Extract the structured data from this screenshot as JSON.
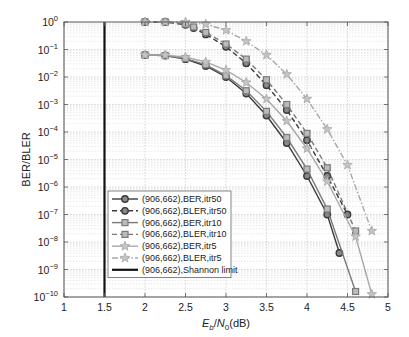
{
  "chart_data": {
    "type": "line",
    "title": "",
    "xlabel": "Eb/N0(dB)",
    "xlabel_parts": {
      "E": "E",
      "b": "b",
      "slash": "/",
      "N": "N",
      "zero": "0",
      "unit": "(dB)"
    },
    "ylabel": "BER/BLER",
    "xlim": [
      1,
      5
    ],
    "ylim_log10": [
      -10,
      0
    ],
    "yscale": "log",
    "grid": true,
    "x_ticks": [
      "1",
      "1.5",
      "2",
      "2.5",
      "3",
      "3.5",
      "4",
      "4.5",
      "5"
    ],
    "y_ticks": [
      {
        "base": "10",
        "exp": "0"
      },
      {
        "base": "10",
        "exp": "−1"
      },
      {
        "base": "10",
        "exp": "−2"
      },
      {
        "base": "10",
        "exp": "−3"
      },
      {
        "base": "10",
        "exp": "−4"
      },
      {
        "base": "10",
        "exp": "−5"
      },
      {
        "base": "10",
        "exp": "−6"
      },
      {
        "base": "10",
        "exp": "−7"
      },
      {
        "base": "10",
        "exp": "−8"
      },
      {
        "base": "10",
        "exp": "−9"
      },
      {
        "base": "10",
        "exp": "−10"
      }
    ],
    "legend_position": "lower-left-inside",
    "series": [
      {
        "name": "(906,662),BER,itr50",
        "marker": "circle",
        "dash": "solid",
        "color": "#3a3a3a",
        "x": [
          2,
          2.25,
          2.5,
          2.75,
          3,
          3.25,
          3.5,
          3.75,
          4,
          4.25,
          4.4
        ],
        "log10_y": [
          -1.2,
          -1.22,
          -1.35,
          -1.6,
          -2.0,
          -2.6,
          -3.4,
          -4.4,
          -5.6,
          -7.0,
          -8.4
        ]
      },
      {
        "name": "(906,662),BLER,itr50",
        "marker": "circle",
        "dash": "dashed",
        "color": "#3a3a3a",
        "x": [
          2,
          2.25,
          2.5,
          2.6,
          2.75,
          3,
          3.25,
          3.5,
          3.75,
          4,
          4.25,
          4.5
        ],
        "log10_y": [
          0,
          0,
          -0.1,
          -0.22,
          -0.45,
          -0.9,
          -1.5,
          -2.3,
          -3.2,
          -4.3,
          -5.6,
          -7.0
        ]
      },
      {
        "name": "(906,662),BER,itr10",
        "marker": "square",
        "dash": "solid",
        "color": "#7a7a7a",
        "x": [
          2,
          2.25,
          2.5,
          2.75,
          3,
          3.25,
          3.5,
          3.75,
          4,
          4.25,
          4.6
        ],
        "log10_y": [
          -1.2,
          -1.22,
          -1.33,
          -1.55,
          -1.95,
          -2.5,
          -3.25,
          -4.2,
          -5.35,
          -6.8,
          -9.8
        ]
      },
      {
        "name": "(906,662),BLER,itr10",
        "marker": "square",
        "dash": "dashed",
        "color": "#7a7a7a",
        "x": [
          2,
          2.25,
          2.5,
          2.6,
          2.75,
          3,
          3.25,
          3.5,
          3.75,
          4,
          4.25,
          4.6
        ],
        "log10_y": [
          0,
          0,
          -0.08,
          -0.18,
          -0.38,
          -0.8,
          -1.35,
          -2.1,
          -3.0,
          -4.05,
          -5.3,
          -7.6
        ]
      },
      {
        "name": "(906,662),BER,itr5",
        "marker": "star",
        "dash": "solid",
        "color": "#a8a8a8",
        "x": [
          2,
          2.25,
          2.5,
          2.75,
          3,
          3.25,
          3.5,
          3.75,
          4,
          4.25,
          4.6,
          4.8
        ],
        "log10_y": [
          -1.2,
          -1.2,
          -1.28,
          -1.45,
          -1.75,
          -2.2,
          -2.8,
          -3.6,
          -4.6,
          -5.8,
          -7.8,
          -9.9
        ]
      },
      {
        "name": "(906,662),BLER,itr5",
        "marker": "star",
        "dash": "dashdot",
        "color": "#a8a8a8",
        "x": [
          2,
          2.25,
          2.5,
          2.75,
          3,
          3.25,
          3.5,
          3.75,
          4,
          4.25,
          4.5,
          4.8
        ],
        "log10_y": [
          0,
          0,
          0,
          -0.08,
          -0.3,
          -0.7,
          -1.2,
          -1.9,
          -2.8,
          -3.9,
          -5.2,
          -7.6
        ]
      },
      {
        "name": "(906,662),Shannon limit",
        "marker": "none",
        "dash": "solid",
        "color": "#111111",
        "x": [
          1.5,
          1.5
        ],
        "log10_y": [
          0,
          -10
        ]
      }
    ]
  }
}
